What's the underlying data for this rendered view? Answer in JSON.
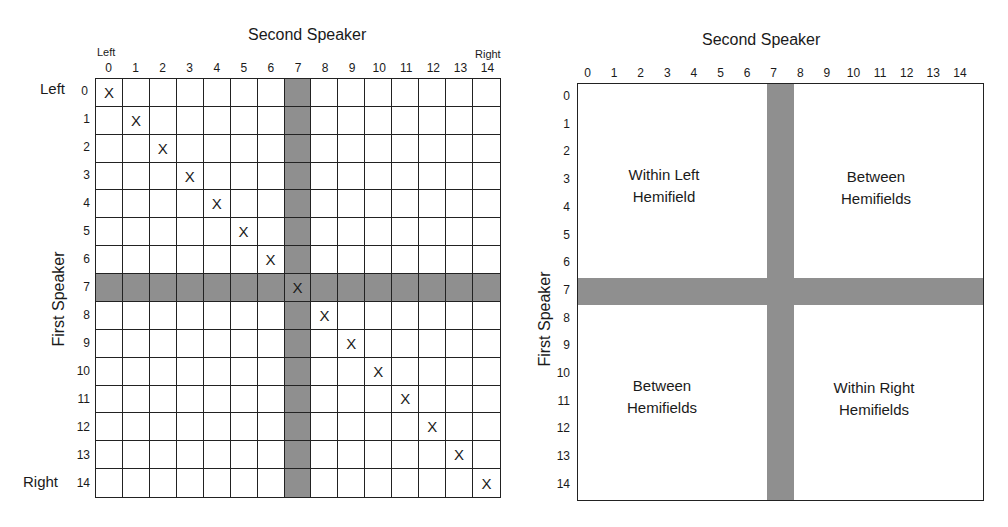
{
  "left_diagram": {
    "title": "Second Speaker",
    "x_axis_left_end_label": "Left",
    "x_axis_right_end_label": "Right",
    "y_axis_label": "First Speaker",
    "y_axis_top_end_label": "Left",
    "y_axis_bottom_end_label": "Right",
    "col_ticks": [
      "0",
      "1",
      "2",
      "3",
      "4",
      "5",
      "6",
      "7",
      "8",
      "9",
      "10",
      "11",
      "12",
      "13",
      "14"
    ],
    "row_ticks": [
      "0",
      "1",
      "2",
      "3",
      "4",
      "5",
      "6",
      "7",
      "8",
      "9",
      "10",
      "11",
      "12",
      "13",
      "14"
    ],
    "shaded_row": 7,
    "shaded_col": 7,
    "marker": "X",
    "marked_cells": [
      [
        0,
        0
      ],
      [
        1,
        1
      ],
      [
        2,
        2
      ],
      [
        3,
        3
      ],
      [
        4,
        4
      ],
      [
        5,
        5
      ],
      [
        6,
        6
      ],
      [
        7,
        7
      ],
      [
        8,
        8
      ],
      [
        9,
        9
      ],
      [
        10,
        10
      ],
      [
        11,
        11
      ],
      [
        12,
        12
      ],
      [
        13,
        13
      ],
      [
        14,
        14
      ]
    ]
  },
  "right_diagram": {
    "title": "Second Speaker",
    "y_axis_label": "First Speaker",
    "col_ticks": [
      "0",
      "1",
      "2",
      "3",
      "4",
      "5",
      "6",
      "7",
      "8",
      "9",
      "10",
      "11",
      "12",
      "13",
      "14"
    ],
    "row_ticks": [
      "0",
      "1",
      "2",
      "3",
      "4",
      "5",
      "6",
      "7",
      "8",
      "9",
      "10",
      "11",
      "12",
      "13",
      "14"
    ],
    "shaded_row": 7,
    "shaded_col": 7,
    "regions": {
      "top_left": [
        "Within Left",
        "Hemifield"
      ],
      "top_right": [
        "Between",
        "Hemifields"
      ],
      "bottom_left": [
        "Between",
        "Hemifields"
      ],
      "bottom_right": [
        "Within Right",
        "Hemifields"
      ]
    }
  },
  "colors": {
    "shade": "#8f8f8f",
    "lines": "#222222",
    "background": "#ffffff"
  }
}
